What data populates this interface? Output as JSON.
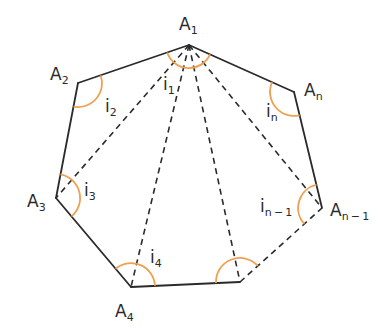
{
  "diagram": {
    "colors": {
      "edge": "#2a2a2a",
      "diagonal": "#2a2a2a",
      "angle_arc": "#f0a050",
      "background": "#ffffff"
    },
    "vertices": [
      {
        "id": "A1",
        "base": "A",
        "sub": "1",
        "x": 189,
        "y": 45
      },
      {
        "id": "A2",
        "base": "A",
        "sub": "2",
        "x": 78,
        "y": 83
      },
      {
        "id": "A3",
        "base": "A",
        "sub": "3",
        "x": 56,
        "y": 198
      },
      {
        "id": "A4",
        "base": "A",
        "sub": "4",
        "x": 131,
        "y": 287
      },
      {
        "id": "A5",
        "base": "",
        "sub": "",
        "x": 240,
        "y": 282
      },
      {
        "id": "An-1",
        "base": "A",
        "sub": "n − 1",
        "x": 322,
        "y": 208
      },
      {
        "id": "An",
        "base": "A",
        "sub": "n",
        "x": 294,
        "y": 92
      }
    ],
    "angle_labels": [
      {
        "id": "i1",
        "base": "i",
        "sub": "1"
      },
      {
        "id": "i2",
        "base": "i",
        "sub": "2"
      },
      {
        "id": "i3",
        "base": "i",
        "sub": "3"
      },
      {
        "id": "i4",
        "base": "i",
        "sub": "4"
      },
      {
        "id": "in-1",
        "base": "i",
        "sub": "n − 1"
      },
      {
        "id": "in",
        "base": "i",
        "sub": "n"
      }
    ],
    "solid_edges": [
      "A1-A2",
      "A2-A3",
      "A3-A4",
      "A4-A5",
      "An-1-An",
      "An-A1"
    ],
    "dashed_edges": [
      "A5-An-1"
    ],
    "diagonals_from_A1": [
      "A3",
      "A4",
      "A5",
      "An-1"
    ]
  }
}
